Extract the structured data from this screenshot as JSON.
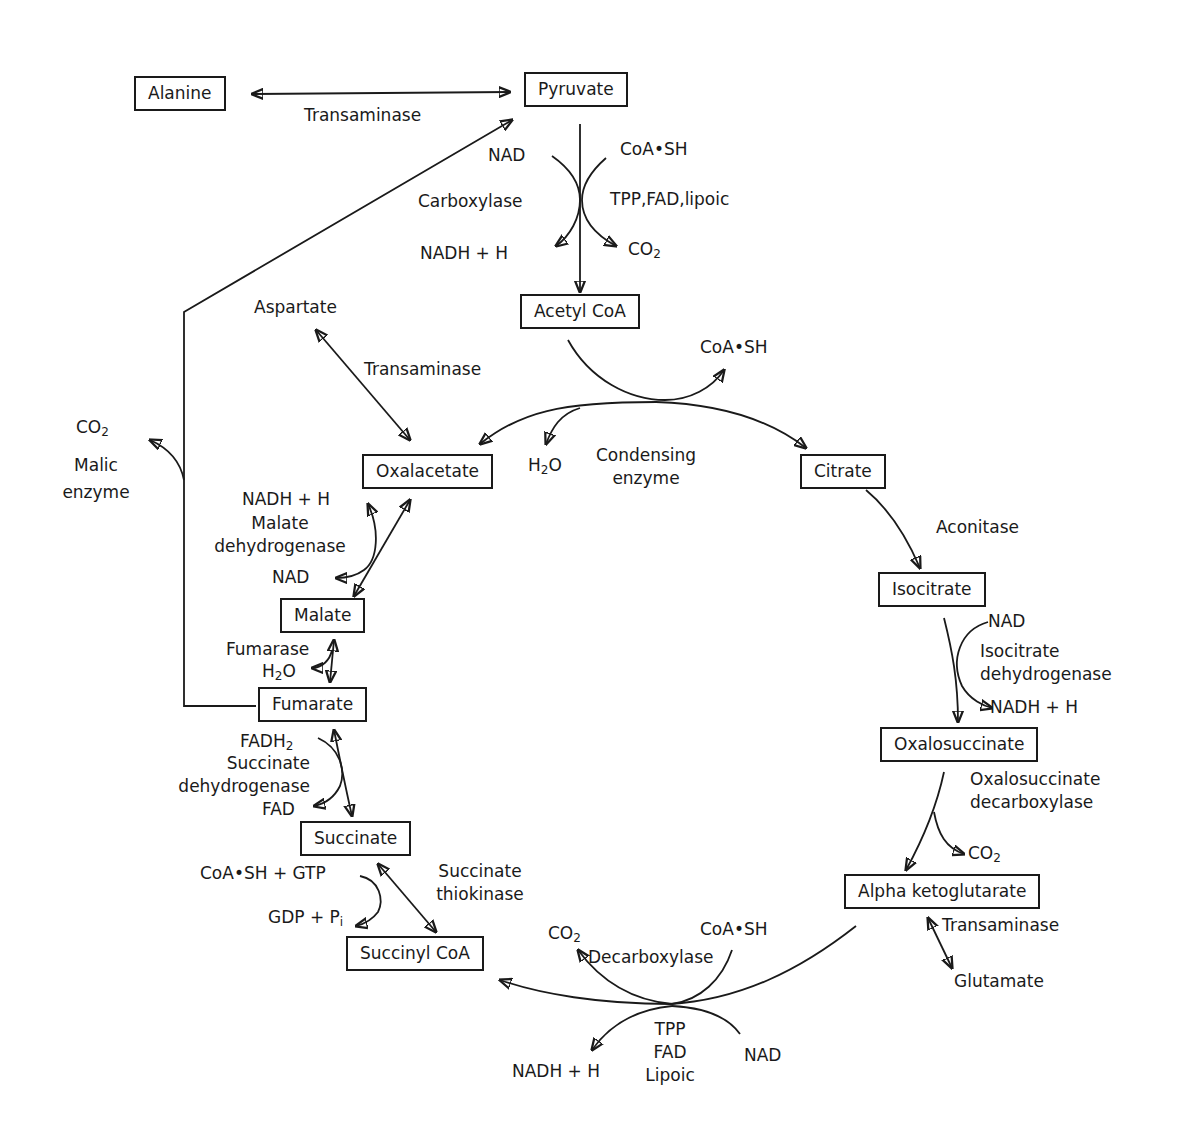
{
  "diagram": {
    "compounds": {
      "alanine": "Alanine",
      "pyruvate": "Pyruvate",
      "acetyl_coa": "Acetyl CoA",
      "oxalacetate": "Oxalacetate",
      "citrate": "Citrate",
      "isocitrate": "Isocitrate",
      "oxalosuccinate": "Oxalosuccinate",
      "alpha_ketoglutarate": "Alpha ketoglutarate",
      "succinyl_coa": "Succinyl CoA",
      "succinate": "Succinate",
      "fumarate": "Fumarate",
      "malate": "Malate"
    },
    "labels": {
      "transaminase_top": "Transaminase",
      "pdh_nad": "NAD",
      "pdh_coash": "CoA•SH",
      "pdh_enzyme": "Carboxylase",
      "pdh_cofactors": "TPP,FAD,lipoic",
      "pdh_nadh": "NADH + H",
      "pdh_co2": "CO",
      "aspartate": "Aspartate",
      "transaminase_asp": "Transaminase",
      "cs_coash": "CoA•SH",
      "cs_h2o": "H",
      "cs_enzyme_1": "Condensing",
      "cs_enzyme_2": "enzyme",
      "malic_co2": "CO",
      "malic_1": "Malic",
      "malic_2": "enzyme",
      "aconitase": "Aconitase",
      "idh_nad": "NAD",
      "idh_enzyme_1": "Isocitrate",
      "idh_enzyme_2": "dehydrogenase",
      "idh_nadh": "NADH + H",
      "osd_enzyme_1": "Oxalosuccinate",
      "osd_enzyme_2": "decarboxylase",
      "osd_co2": "CO",
      "transaminase_akg": "Transaminase",
      "glutamate": "Glutamate",
      "akgdh_co2": "CO",
      "akgdh_enzyme": "Decarboxylase",
      "akgdh_coash": "CoA•SH",
      "akgdh_cof_1": "TPP",
      "akgdh_cof_2": "FAD",
      "akgdh_cof_3": "Lipoic",
      "akgdh_nad": "NAD",
      "akgdh_nadh": "NADH + H",
      "stk_1": "Succinate",
      "stk_2": "thiokinase",
      "stk_coash_gtp": "CoA•SH + GTP",
      "stk_gdp_pi": "GDP + P",
      "stk_pi_sub": "i",
      "sdh_fadh2": "FADH",
      "sdh_1": "Succinate",
      "sdh_2": "dehydrogenase",
      "sdh_fad": "FAD",
      "fumarase": "Fumarase",
      "fum_h2o": "H",
      "mdh_nadh": "NADH + H",
      "mdh_1": "Malate",
      "mdh_2": "dehydrogenase",
      "mdh_nad": "NAD",
      "sub_2": "2",
      "o_suffix": "O"
    }
  }
}
